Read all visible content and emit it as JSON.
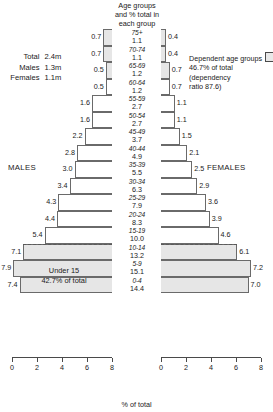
{
  "header": {
    "caption_lines": [
      "Age groups",
      "and % total in",
      "each group"
    ]
  },
  "summary": {
    "rows": [
      {
        "label": "Total",
        "value": "2.4m"
      },
      {
        "label": "Males",
        "value": "1.3m"
      },
      {
        "label": "Females",
        "value": "1.1m"
      }
    ]
  },
  "legend": {
    "label": "Dependent age groups",
    "line2": "46.7% of total (dependency",
    "line3": "ratio 87.6)",
    "swatch_color": "#e8e8e8"
  },
  "labels": {
    "males": "MALES",
    "females": "FEMALES",
    "under15_line1": "Under 15",
    "under15_line2": "42.7% of total",
    "axis_title": "% of total"
  },
  "chart_data": {
    "type": "bar",
    "xlabel": "% of total",
    "ylabel": "Age groups",
    "orientation": "horizontal-diverging",
    "xlim": [
      0,
      8
    ],
    "xticks": [
      0,
      2,
      4,
      6,
      8
    ],
    "xtick_labels_left": [
      "8",
      "6",
      "4",
      "2",
      "0"
    ],
    "xtick_labels_right": [
      "0",
      "2",
      "4",
      "6",
      "8"
    ],
    "grid": false,
    "legend_position": "top-right",
    "categories": [
      "75+",
      "70-74",
      "65-69",
      "60-64",
      "55-59",
      "50-54",
      "45-49",
      "40-44",
      "35-39",
      "30-34",
      "25-29",
      "20-24",
      "15-19",
      "10-14",
      "5-9",
      "0-4"
    ],
    "center_totals": [
      "1.1",
      "1.1",
      "1.2",
      "1.2",
      "2.7",
      "2.7",
      "3.7",
      "4.9",
      "5.5",
      "6.3",
      "7.9",
      "8.3",
      "10.0",
      "13.2",
      "15.1",
      "14.4"
    ],
    "series": [
      {
        "name": "MALES",
        "side": "left",
        "values": [
          0.7,
          0.7,
          0.5,
          0.5,
          1.6,
          1.6,
          2.2,
          2.8,
          3.0,
          3.4,
          4.3,
          4.4,
          5.4,
          7.1,
          7.9,
          7.4
        ]
      },
      {
        "name": "FEMALES",
        "side": "right",
        "values": [
          0.4,
          0.4,
          0.7,
          0.7,
          1.1,
          1.1,
          1.5,
          2.1,
          2.5,
          2.9,
          3.6,
          3.9,
          4.6,
          6.1,
          7.2,
          7.0
        ]
      }
    ],
    "dependent_groups": [
      "75+",
      "70-74",
      "65-69",
      "10-14",
      "5-9",
      "0-4"
    ],
    "dependent_share": "46.7% of total",
    "dependency_ratio": "87.6",
    "population_total": "2.4m",
    "population_males": "1.3m",
    "population_females": "1.1m",
    "under15_share": "42.7% of total"
  }
}
